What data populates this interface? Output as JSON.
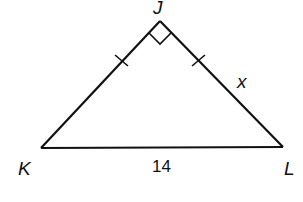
{
  "diagram": {
    "type": "right isosceles triangle",
    "vertices": {
      "top": "J",
      "left": "K",
      "right": "L"
    },
    "right_angle_at": "J",
    "congruent_sides": [
      "JK",
      "JL"
    ],
    "side_labels": {
      "KL": "14",
      "JL": "x"
    },
    "colors": {
      "stroke": "#111111",
      "background": "#ffffff"
    }
  }
}
